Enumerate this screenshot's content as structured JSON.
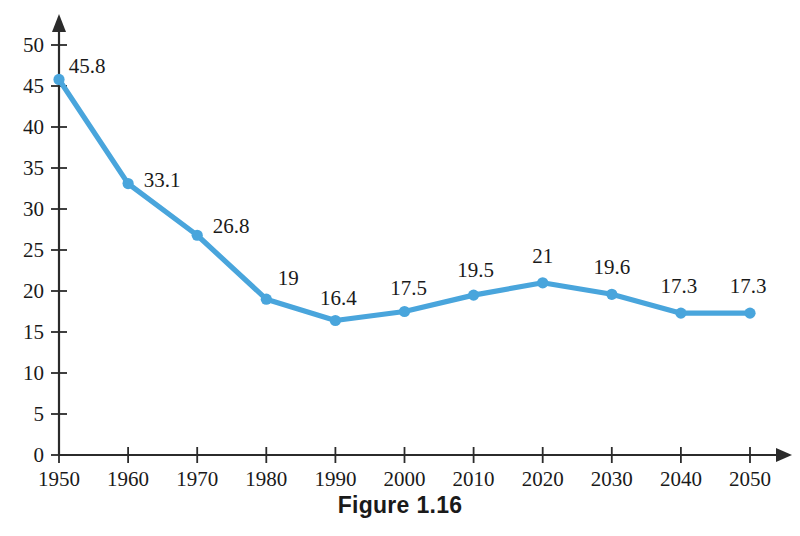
{
  "caption": "Figure 1.16",
  "colors": {
    "series": "#49a5dc",
    "axis": "#2b2b2b",
    "text": "#1a1a1a",
    "background": "#ffffff"
  },
  "chart_data": {
    "type": "line",
    "title": "",
    "subtitle": "",
    "xlabel": "",
    "ylabel": "",
    "categories": [
      1950,
      1960,
      1970,
      1980,
      1990,
      2000,
      2010,
      2020,
      2030,
      2040,
      2050
    ],
    "x_tick_labels": [
      "1950",
      "1960",
      "1970",
      "1980",
      "1990",
      "2000",
      "2010",
      "2020",
      "2030",
      "2040",
      "2050"
    ],
    "values": [
      45.8,
      33.1,
      26.8,
      19,
      16.4,
      17.5,
      19.5,
      21,
      19.6,
      17.3,
      17.3
    ],
    "point_labels": [
      "45.8",
      "33.1",
      "26.8",
      "19",
      "16.4",
      "17.5",
      "19.5",
      "21",
      "19.6",
      "17.3",
      "17.3"
    ],
    "y_ticks": [
      0,
      5,
      10,
      15,
      20,
      25,
      30,
      35,
      40,
      45,
      50
    ],
    "y_tick_labels": [
      "0",
      "5",
      "10",
      "15",
      "20",
      "25",
      "30",
      "35",
      "40",
      "45",
      "50"
    ],
    "ylim": [
      0,
      50
    ],
    "xlim": [
      1950,
      2050
    ],
    "grid": false,
    "legend": "none",
    "marker": "circle",
    "series_name": ""
  }
}
